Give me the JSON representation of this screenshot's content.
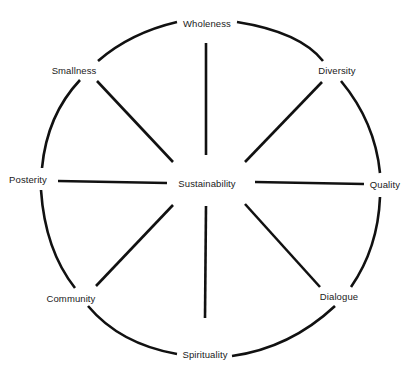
{
  "diagram": {
    "type": "radial-concept-wheel",
    "center_label": "Sustainability",
    "center": {
      "x": 207,
      "y": 184
    },
    "nodes": [
      {
        "id": "wholeness",
        "label": "Wholeness",
        "x": 207,
        "y": 24
      },
      {
        "id": "diversity",
        "label": "Diversity",
        "x": 337,
        "y": 71
      },
      {
        "id": "quality",
        "label": "Quality",
        "x": 385,
        "y": 185
      },
      {
        "id": "dialogue",
        "label": "Dialogue",
        "x": 339,
        "y": 297
      },
      {
        "id": "spirituality",
        "label": "Spirituality",
        "x": 205,
        "y": 355
      },
      {
        "id": "community",
        "label": "Community",
        "x": 71,
        "y": 299
      },
      {
        "id": "posterity",
        "label": "Posterity",
        "x": 28,
        "y": 180
      },
      {
        "id": "smallness",
        "label": "Smallness",
        "x": 74,
        "y": 71
      }
    ],
    "spokes": [
      {
        "to": "wholeness",
        "x1": 206,
        "y1": 43,
        "x2": 206,
        "y2": 155
      },
      {
        "to": "diversity",
        "x1": 322,
        "y1": 82,
        "x2": 245,
        "y2": 162
      },
      {
        "to": "quality",
        "x1": 255,
        "y1": 182,
        "x2": 364,
        "y2": 184
      },
      {
        "to": "dialogue",
        "x1": 245,
        "y1": 204,
        "x2": 320,
        "y2": 287
      },
      {
        "to": "spirituality",
        "x1": 206,
        "y1": 206,
        "x2": 205,
        "y2": 318
      },
      {
        "to": "community",
        "x1": 173,
        "y1": 205,
        "x2": 96,
        "y2": 286
      },
      {
        "to": "posterity",
        "x1": 58,
        "y1": 181,
        "x2": 167,
        "y2": 183
      },
      {
        "to": "smallness",
        "x1": 97,
        "y1": 81,
        "x2": 173,
        "y2": 162
      }
    ],
    "arcs": [
      {
        "from": "wholeness",
        "to": "diversity",
        "d": "M 237 22 Q 300 32 323 61"
      },
      {
        "from": "diversity",
        "to": "quality",
        "d": "M 341 81 Q 375 122 380 173"
      },
      {
        "from": "quality",
        "to": "dialogue",
        "d": "M 380 197 Q 378 248 351 287"
      },
      {
        "from": "dialogue",
        "to": "spirituality",
        "d": "M 335 306 Q 290 348 232 356"
      },
      {
        "from": "spirituality",
        "to": "community",
        "d": "M 177 354 Q 120 344 88 306"
      },
      {
        "from": "community",
        "to": "posterity",
        "d": "M 75 288 Q 45 250 41 190"
      },
      {
        "from": "posterity",
        "to": "smallness",
        "d": "M 42 168 Q 47 115 80 80"
      },
      {
        "from": "smallness",
        "to": "wholeness",
        "d": "M 98 61 Q 130 33 177 22"
      }
    ],
    "stroke_color": "#111111",
    "background_color": "#ffffff"
  }
}
